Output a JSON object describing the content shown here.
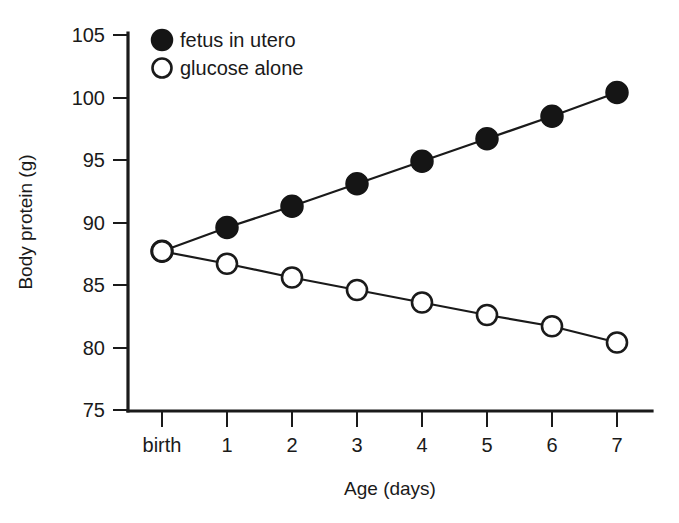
{
  "chart_data": {
    "type": "line",
    "title": "",
    "subtitle": "",
    "xlabel": "Age (days)",
    "ylabel": "Body protein (g)",
    "x": [
      0,
      1,
      2,
      3,
      4,
      5,
      6,
      7
    ],
    "xtick_labels": [
      "birth",
      "1",
      "2",
      "3",
      "4",
      "5",
      "6",
      "7"
    ],
    "ytick_labels": [
      "105",
      "100",
      "95",
      "90",
      "85",
      "80",
      "75"
    ],
    "ytick_values": [
      105,
      100,
      95,
      90,
      85,
      80,
      75
    ],
    "xlim": [
      0,
      7
    ],
    "ylim": [
      75,
      105
    ],
    "grid": false,
    "legend_position": "top-left",
    "series": [
      {
        "name": "fetus in utero",
        "marker": "filled-circle",
        "values": [
          87.7,
          89.6,
          91.3,
          93.1,
          94.9,
          96.7,
          98.5,
          100.4
        ]
      },
      {
        "name": "glucose alone",
        "marker": "open-circle",
        "values": [
          87.7,
          86.7,
          85.6,
          84.6,
          83.6,
          82.6,
          81.7,
          80.4
        ]
      }
    ]
  },
  "legend": {
    "items": [
      {
        "label": "fetus in utero",
        "marker": "filled-circle"
      },
      {
        "label": "glucose alone",
        "marker": "open-circle"
      }
    ]
  },
  "axes": {
    "x_title": "Age (days)",
    "y_title": "Body protein (g)"
  },
  "colors": {
    "ink": "#1a1a1a",
    "background": "#ffffff",
    "marker_fill": "#151515",
    "marker_open": "#ffffff"
  }
}
